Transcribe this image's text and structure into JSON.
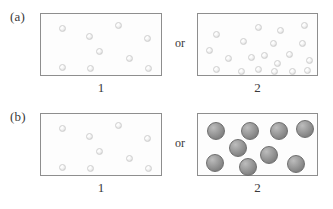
{
  "figure": {
    "width": 333,
    "height": 209,
    "background_color": "#ffffff",
    "box_border_color": "#8e8e8e",
    "small_sphere_color": "#ededed",
    "large_sphere_color": "#939393"
  },
  "panels": [
    {
      "id": "a",
      "label": "(a)",
      "connector": "or",
      "boxes": [
        {
          "id": "a1",
          "caption": "1",
          "sphere_count": 9,
          "sphere_size": "small",
          "spheres": [
            {
              "x": 18,
              "y": 11
            },
            {
              "x": 45,
              "y": 19
            },
            {
              "x": 74,
              "y": 8
            },
            {
              "x": 103,
              "y": 21
            },
            {
              "x": 55,
              "y": 34
            },
            {
              "x": 85,
              "y": 41
            },
            {
              "x": 18,
              "y": 50
            },
            {
              "x": 46,
              "y": 51
            },
            {
              "x": 104,
              "y": 51
            }
          ]
        },
        {
          "id": "a2",
          "caption": "2",
          "sphere_count": 20,
          "sphere_size": "small",
          "spheres": [
            {
              "x": 15,
              "y": 17
            },
            {
              "x": 42,
              "y": 24
            },
            {
              "x": 57,
              "y": 10
            },
            {
              "x": 79,
              "y": 13
            },
            {
              "x": 72,
              "y": 26
            },
            {
              "x": 103,
              "y": 8
            },
            {
              "x": 101,
              "y": 26
            },
            {
              "x": 8,
              "y": 33
            },
            {
              "x": 27,
              "y": 41
            },
            {
              "x": 50,
              "y": 40
            },
            {
              "x": 88,
              "y": 37
            },
            {
              "x": 108,
              "y": 43
            },
            {
              "x": 76,
              "y": 46
            },
            {
              "x": 15,
              "y": 52
            },
            {
              "x": 40,
              "y": 54
            },
            {
              "x": 57,
              "y": 52
            },
            {
              "x": 73,
              "y": 54
            },
            {
              "x": 91,
              "y": 54
            },
            {
              "x": 106,
              "y": 53
            },
            {
              "x": 63,
              "y": 38
            }
          ]
        }
      ]
    },
    {
      "id": "b",
      "label": "(b)",
      "connector": "or",
      "boxes": [
        {
          "id": "b1",
          "caption": "1",
          "sphere_count": 9,
          "sphere_size": "small",
          "spheres": [
            {
              "x": 18,
              "y": 11
            },
            {
              "x": 45,
              "y": 19
            },
            {
              "x": 74,
              "y": 8
            },
            {
              "x": 103,
              "y": 21
            },
            {
              "x": 55,
              "y": 34
            },
            {
              "x": 85,
              "y": 41
            },
            {
              "x": 18,
              "y": 50
            },
            {
              "x": 46,
              "y": 51
            },
            {
              "x": 104,
              "y": 51
            }
          ]
        },
        {
          "id": "b2",
          "caption": "2",
          "sphere_count": 9,
          "sphere_size": "large",
          "spheres": [
            {
              "x": 9,
              "y": 8
            },
            {
              "x": 43,
              "y": 8
            },
            {
              "x": 72,
              "y": 8
            },
            {
              "x": 98,
              "y": 6
            },
            {
              "x": 31,
              "y": 25
            },
            {
              "x": 62,
              "y": 32
            },
            {
              "x": 8,
              "y": 40
            },
            {
              "x": 41,
              "y": 44
            },
            {
              "x": 89,
              "y": 41
            }
          ]
        }
      ]
    }
  ]
}
